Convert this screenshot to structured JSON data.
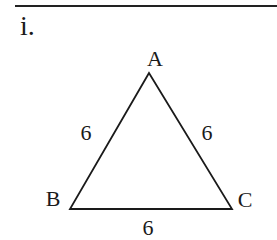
{
  "problem": {
    "number": "i.",
    "triangle": {
      "vertices": [
        {
          "name": "A",
          "x": 149,
          "y": 73,
          "label_x": 155,
          "label_y": 59
        },
        {
          "name": "B",
          "x": 70,
          "y": 209,
          "label_x": 53,
          "label_y": 199
        },
        {
          "name": "C",
          "x": 232,
          "y": 209,
          "label_x": 245,
          "label_y": 200
        }
      ],
      "sides": [
        {
          "name": "AB",
          "length": "6",
          "label_x": 86,
          "label_y": 133
        },
        {
          "name": "AC",
          "length": "6",
          "label_x": 207,
          "label_y": 133
        },
        {
          "name": "BC",
          "length": "6",
          "label_x": 148,
          "label_y": 228
        }
      ],
      "stroke_color": "#1a1a1a"
    }
  }
}
